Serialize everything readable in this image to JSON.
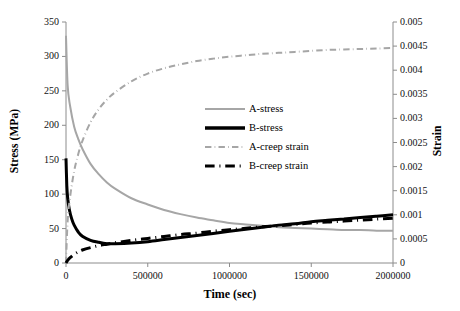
{
  "chart_data": {
    "type": "line",
    "title": "",
    "xlabel": "Time (sec)",
    "ylabel": "Stress (MPa)",
    "y2label": "Strain",
    "xlim": [
      0,
      2000000
    ],
    "ylim": [
      0,
      350
    ],
    "y2lim": [
      0,
      0.005
    ],
    "grid": false,
    "legend_position": "center",
    "xticks": [
      "0",
      "500000",
      "1000000",
      "1500000",
      "2000000"
    ],
    "xtick_values": [
      0,
      500000,
      1000000,
      1500000,
      2000000
    ],
    "yticks": [
      "0",
      "50",
      "100",
      "150",
      "200",
      "250",
      "300",
      "350"
    ],
    "ytick_values": [
      0,
      50,
      100,
      150,
      200,
      250,
      300,
      350
    ],
    "y2ticks": [
      "0",
      "0.0005",
      "0.001",
      "0.0015",
      "0.002",
      "0.0025",
      "0.003",
      "0.0035",
      "0.004",
      "0.0045",
      "0.005"
    ],
    "y2tick_values": [
      0,
      0.0005,
      0.001,
      0.0015,
      0.002,
      0.0025,
      0.003,
      0.0035,
      0.004,
      0.0045,
      0.005
    ],
    "series": [
      {
        "name": "A-stress",
        "axis": "left",
        "color": "#a6a6a6",
        "style": "solid",
        "width": 2,
        "x": [
          0,
          10000,
          25000,
          50000,
          75000,
          100000,
          150000,
          200000,
          250000,
          300000,
          400000,
          500000,
          600000,
          700000,
          800000,
          900000,
          1000000,
          1100000,
          1200000,
          1300000,
          1400000,
          1500000,
          1600000,
          1700000,
          1800000,
          1900000,
          2000000
        ],
        "y": [
          330,
          258,
          228,
          198,
          180,
          166,
          144,
          129,
          117,
          108,
          94,
          85,
          77,
          71,
          66,
          62,
          58,
          56,
          54,
          52,
          51,
          50,
          49,
          48,
          48,
          47,
          47
        ]
      },
      {
        "name": "B-stress",
        "axis": "left",
        "color": "#000000",
        "style": "solid",
        "width": 3,
        "x": [
          0,
          5000,
          10000,
          20000,
          35000,
          50000,
          75000,
          100000,
          150000,
          200000,
          250000,
          300000,
          400000,
          500000,
          600000,
          700000,
          800000,
          900000,
          1000000,
          1100000,
          1200000,
          1300000,
          1400000,
          1500000,
          1600000,
          1700000,
          1800000,
          1900000,
          2000000
        ],
        "y": [
          152,
          112,
          95,
          78,
          64,
          55,
          45,
          39,
          33,
          30,
          28,
          28,
          29,
          31,
          34,
          37,
          40,
          43,
          46,
          49,
          52,
          55,
          57,
          60,
          62,
          64,
          66,
          68,
          70
        ]
      },
      {
        "name": "A-creep strain",
        "axis": "right",
        "color": "#a6a6a6",
        "style": "dashdot",
        "width": 2,
        "x": [
          0,
          10000,
          25000,
          50000,
          75000,
          100000,
          150000,
          200000,
          250000,
          300000,
          400000,
          500000,
          600000,
          700000,
          800000,
          900000,
          1000000,
          1100000,
          1200000,
          1300000,
          1400000,
          1500000,
          1600000,
          1700000,
          1800000,
          1900000,
          2000000
        ],
        "y": [
          0.0,
          0.00087,
          0.00137,
          0.00191,
          0.00226,
          0.00253,
          0.00292,
          0.00319,
          0.00339,
          0.00354,
          0.00377,
          0.00393,
          0.00404,
          0.00412,
          0.00419,
          0.00424,
          0.00428,
          0.00431,
          0.00434,
          0.00436,
          0.00438,
          0.0044,
          0.00442,
          0.00443,
          0.00444,
          0.00445,
          0.00446
        ]
      },
      {
        "name": "B-creep strain",
        "axis": "right",
        "color": "#000000",
        "style": "dashdot",
        "width": 3,
        "x": [
          0,
          10000,
          25000,
          50000,
          75000,
          100000,
          150000,
          200000,
          250000,
          300000,
          400000,
          500000,
          600000,
          700000,
          800000,
          900000,
          1000000,
          1100000,
          1200000,
          1300000,
          1400000,
          1500000,
          1600000,
          1700000,
          1800000,
          1900000,
          2000000
        ],
        "y": [
          0.0,
          5.5e-05,
          0.00011,
          0.00018,
          0.00023,
          0.00027,
          0.00032,
          0.00036,
          0.00039,
          0.00042,
          0.00047,
          0.00051,
          0.00055,
          0.00059,
          0.00062,
          0.00066,
          0.00069,
          0.00072,
          0.00075,
          0.00077,
          0.0008,
          0.00083,
          0.00085,
          0.00087,
          0.00089,
          0.00091,
          0.00093
        ]
      }
    ],
    "legend": [
      {
        "label": "A-stress",
        "color": "#a6a6a6",
        "style": "solid",
        "width": 2
      },
      {
        "label": "B-stress",
        "color": "#000000",
        "style": "solid",
        "width": 3.5
      },
      {
        "label": "A-creep strain",
        "color": "#a6a6a6",
        "style": "dashdot",
        "width": 2
      },
      {
        "label": "B-creep strain",
        "color": "#000000",
        "style": "dashdot",
        "width": 3
      }
    ]
  },
  "axis_color": "#8c8c8c",
  "plot_area": {
    "left": 66,
    "top": 22,
    "right": 393,
    "bottom": 263
  }
}
